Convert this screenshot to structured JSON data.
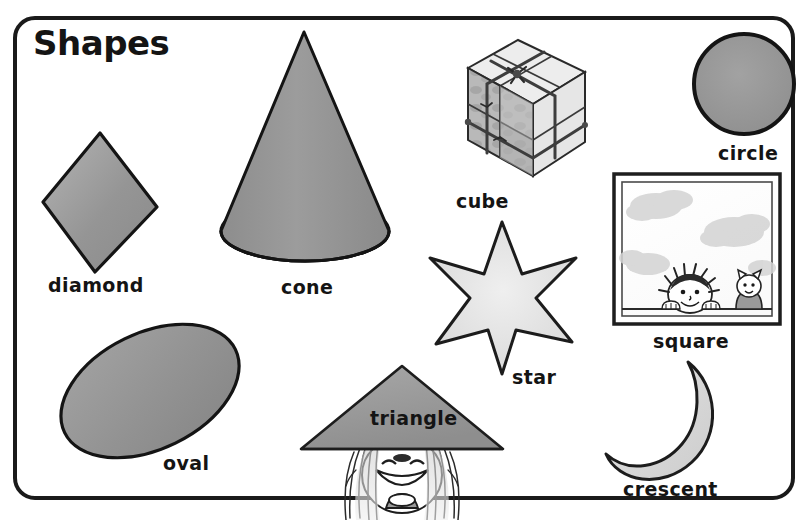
{
  "page": {
    "title": "Shapes",
    "background_color": "#ffffff",
    "border_color": "#1a1a1a"
  },
  "palette": {
    "outline": "#141414",
    "mid_gray": "#8e8e8e",
    "light_gray": "#d8d8d8",
    "pale_gray": "#ececec",
    "dark_gray": "#a5a5a5",
    "text": "#141414"
  },
  "shapes": [
    {
      "id": "diamond",
      "label": "diamond",
      "kind": "2d",
      "description": "gray rhombus outlined in black"
    },
    {
      "id": "cone",
      "label": "cone",
      "kind": "3d",
      "description": "gray cone with pale elliptical base"
    },
    {
      "id": "cube",
      "label": "cube",
      "kind": "3d",
      "description": "isometric box of eight small cubes tied with string"
    },
    {
      "id": "circle",
      "label": "circle",
      "kind": "2d",
      "description": "gray filled circle with thick black outline"
    },
    {
      "id": "square",
      "label": "square",
      "kind": "2d",
      "description": "square window frame with sky, a child and a cat looking in"
    },
    {
      "id": "star",
      "label": "star",
      "kind": "2d",
      "description": "six-pointed pale gray star"
    },
    {
      "id": "oval",
      "label": "oval",
      "kind": "2d",
      "description": "tilted gray ellipse"
    },
    {
      "id": "triangle",
      "label": "triangle",
      "kind": "2d",
      "description": "gray conical hat worn by a smiling child"
    },
    {
      "id": "crescent",
      "label": "crescent",
      "kind": "2d",
      "description": "pale gray crescent moon opening to the left"
    }
  ]
}
